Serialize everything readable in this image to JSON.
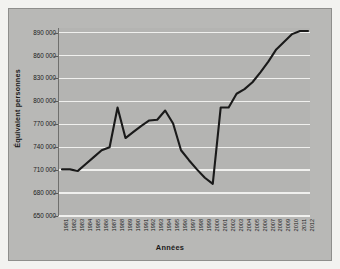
{
  "chart_data": {
    "type": "line",
    "title": "",
    "xlabel": "Années",
    "ylabel": "Équivalent personnes",
    "grid": true,
    "legend": false,
    "line_color": "#1a1a1a",
    "plot_background": "#b4b4b2",
    "gridline_color": "#f0f0ee",
    "ylim": [
      650000,
      896000
    ],
    "yticks": [
      650000,
      680000,
      710000,
      740000,
      770000,
      800000,
      830000,
      860000,
      890000
    ],
    "ytick_labels": [
      "650 000",
      "680 000",
      "710 000",
      "740 000",
      "770 000",
      "800 000",
      "830 000",
      "860 000",
      "890 000"
    ],
    "categories": [
      "1981",
      "1982",
      "1983",
      "1984",
      "1985",
      "1986",
      "1987",
      "1988",
      "1989",
      "1990",
      "1991",
      "1992",
      "1993",
      "1994",
      "1995",
      "1996",
      "1997",
      "1998",
      "1999",
      "2000",
      "2001",
      "2002",
      "2003",
      "2004",
      "2005",
      "2006",
      "2007",
      "2008",
      "2009",
      "2010",
      "2011",
      "2012"
    ],
    "values": [
      711000,
      711000,
      709000,
      718000,
      727000,
      736000,
      740000,
      792000,
      752000,
      760000,
      768000,
      775000,
      776000,
      788000,
      771000,
      736000,
      723000,
      711000,
      700000,
      692000,
      792000,
      792000,
      810000,
      816000,
      825000,
      838000,
      852000,
      868000,
      878000,
      888000,
      892000,
      892000
    ]
  }
}
